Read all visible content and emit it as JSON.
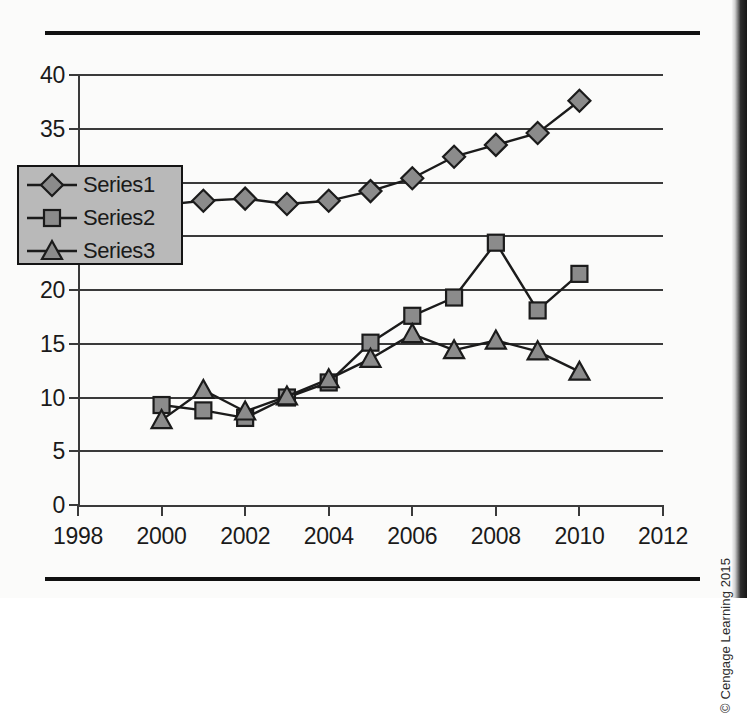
{
  "figure": {
    "copyright": "© Cengage Learning 2015"
  },
  "chart_data": {
    "type": "line",
    "title": "",
    "xlabel": "",
    "ylabel": "",
    "xlim": [
      1998,
      2012
    ],
    "ylim": [
      0,
      40
    ],
    "grid": true,
    "legend_position": "inside-left",
    "x_ticks": [
      1998,
      2000,
      2002,
      2004,
      2006,
      2008,
      2010,
      2012
    ],
    "y_ticks": [
      0,
      5,
      10,
      15,
      20,
      25,
      30,
      35,
      40
    ],
    "x": [
      2000,
      2001,
      2002,
      2003,
      2004,
      2005,
      2006,
      2007,
      2008,
      2009,
      2010
    ],
    "series": [
      {
        "name": "Series1",
        "marker": "diamond",
        "values": [
          27.9,
          28.3,
          28.5,
          28.0,
          28.3,
          29.2,
          30.4,
          32.4,
          33.5,
          34.6,
          37.6
        ]
      },
      {
        "name": "Series2",
        "marker": "square",
        "values": [
          9.3,
          8.8,
          8.1,
          10.0,
          11.4,
          15.1,
          17.6,
          19.3,
          24.4,
          18.1,
          21.5
        ]
      },
      {
        "name": "Series3",
        "marker": "triangle",
        "values": [
          7.9,
          10.7,
          8.7,
          10.1,
          11.7,
          13.6,
          15.9,
          14.4,
          15.3,
          14.3,
          12.4
        ]
      }
    ],
    "colors": {
      "marker_fill": "#8b8b8b",
      "line": "#1b1b1b",
      "legend_background": "#b9b9b9",
      "grid": "#3a3a3a"
    }
  }
}
